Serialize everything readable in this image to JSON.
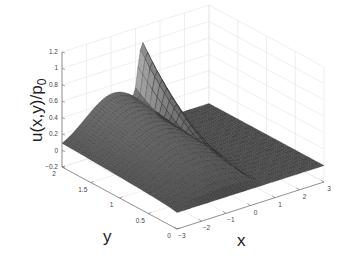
{
  "chart_data": {
    "type": "surface",
    "title": "",
    "zlabel": "u(x,y)/p",
    "zlabel_subscript": "0",
    "xlabel": "x",
    "ylabel": "y",
    "x_ticks": [
      "−3",
      "−2",
      "−1",
      "0",
      "1",
      "2",
      "3"
    ],
    "x_tick_values": [
      -3,
      -2,
      -1,
      0,
      1,
      2,
      3
    ],
    "y_ticks": [
      "0",
      "0.5",
      "1",
      "1.5",
      "2"
    ],
    "y_tick_values": [
      0,
      0.5,
      1,
      1.5,
      2
    ],
    "z_ticks": [
      "−0.2",
      "0",
      "0.2",
      "0.4",
      "0.6",
      "0.8",
      "1",
      "1.2"
    ],
    "z_tick_values": [
      -0.2,
      0,
      0.2,
      0.4,
      0.6,
      0.8,
      1,
      1.2
    ],
    "xlim": [
      -3,
      3
    ],
    "ylim": [
      0,
      2
    ],
    "zlim": [
      -0.2,
      1.2
    ],
    "grid": true,
    "colormap": "gray",
    "sample_profile": {
      "x": [
        -3,
        -2,
        -1,
        0,
        0.3,
        0.6,
        1,
        2,
        3
      ],
      "u_at_y2": [
        0.05,
        0.35,
        0.5,
        0.75,
        1.0,
        0.6,
        0.0,
        0.0,
        0.0
      ],
      "u_at_y0": [
        0.0,
        0.0,
        0.0,
        0.0,
        0.0,
        0.0,
        0.0,
        0.0,
        0.0
      ]
    }
  }
}
